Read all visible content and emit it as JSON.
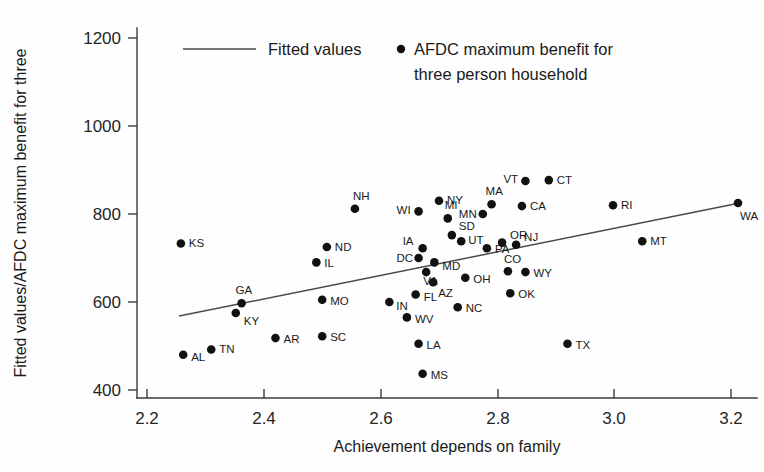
{
  "chart_data": {
    "type": "scatter",
    "title": "",
    "xlabel": "Achievement depends on family",
    "ylabel": "Fitted values/AFDC maximum benefit for three",
    "xlim": [
      2.15,
      3.26
    ],
    "ylim": [
      390,
      1240
    ],
    "xticks": [
      "2.2",
      "2.4",
      "2.6",
      "2.8",
      "3.0",
      "3.2"
    ],
    "xtick_values": [
      2.2,
      2.4,
      2.6,
      2.8,
      3.0,
      3.2
    ],
    "yticks": [
      "400",
      "600",
      "800",
      "1000",
      "1200"
    ],
    "ytick_values": [
      400,
      600,
      800,
      1000,
      1200
    ],
    "grid": false,
    "legend_position": "top-center",
    "legend": [
      {
        "label": "Fitted values",
        "marker": "line"
      },
      {
        "label": "AFDC maximum benefit for",
        "label2": "three person household",
        "marker": "dot"
      }
    ],
    "series": [
      {
        "name": "AFDC maximum benefit for three person household",
        "marker": "dot",
        "points": [
          {
            "label": "KS",
            "x": 2.258,
            "y": 733,
            "lx": 8,
            "ly": 4
          },
          {
            "label": "GA",
            "x": 2.362,
            "y": 597,
            "lx": -6,
            "ly": -9
          },
          {
            "label": "KY",
            "x": 2.352,
            "y": 575,
            "lx": 8,
            "ly": 12
          },
          {
            "label": "AL",
            "x": 2.262,
            "y": 480,
            "lx": 8,
            "ly": 6
          },
          {
            "label": "TN",
            "x": 2.31,
            "y": 492,
            "lx": 8,
            "ly": 3
          },
          {
            "label": "AR",
            "x": 2.42,
            "y": 518,
            "lx": 8,
            "ly": 5
          },
          {
            "label": "SC",
            "x": 2.5,
            "y": 522,
            "lx": 8,
            "ly": 5
          },
          {
            "label": "MO",
            "x": 2.5,
            "y": 605,
            "lx": 8,
            "ly": 5
          },
          {
            "label": "IL",
            "x": 2.49,
            "y": 690,
            "lx": 8,
            "ly": 5
          },
          {
            "label": "ND",
            "x": 2.508,
            "y": 725,
            "lx": 8,
            "ly": 4
          },
          {
            "label": "NH",
            "x": 2.556,
            "y": 812,
            "lx": -2,
            "ly": -9
          },
          {
            "label": "IN",
            "x": 2.615,
            "y": 600,
            "lx": 7,
            "ly": 8
          },
          {
            "label": "WV",
            "x": 2.645,
            "y": 565,
            "lx": 8,
            "ly": 6
          },
          {
            "label": "WI",
            "x": 2.665,
            "y": 806,
            "lx": -22,
            "ly": 3
          },
          {
            "label": "FL",
            "x": 2.66,
            "y": 617,
            "lx": 8,
            "ly": 6
          },
          {
            "label": "DC",
            "x": 2.665,
            "y": 700,
            "lx": -22,
            "ly": 4
          },
          {
            "label": "IA",
            "x": 2.672,
            "y": 722,
            "lx": -20,
            "ly": -3
          },
          {
            "label": "NY",
            "x": 2.7,
            "y": 830,
            "lx": 8,
            "ly": 3
          },
          {
            "label": "VA",
            "x": 2.678,
            "y": 668,
            "lx": -3,
            "ly": 13
          },
          {
            "label": "MD",
            "x": 2.692,
            "y": 690,
            "lx": 8,
            "ly": 8
          },
          {
            "label": "AZ",
            "x": 2.69,
            "y": 645,
            "lx": 5,
            "ly": 15
          },
          {
            "label": "MS",
            "x": 2.672,
            "y": 437,
            "lx": 8,
            "ly": 5
          },
          {
            "label": "LA",
            "x": 2.665,
            "y": 505,
            "lx": 8,
            "ly": 5
          },
          {
            "label": "MI",
            "x": 2.715,
            "y": 790,
            "lx": -3,
            "ly": -9
          },
          {
            "label": "SD",
            "x": 2.722,
            "y": 752,
            "lx": 7,
            "ly": -5
          },
          {
            "label": "UT",
            "x": 2.738,
            "y": 738,
            "lx": 7,
            "ly": 3
          },
          {
            "label": "OH",
            "x": 2.745,
            "y": 655,
            "lx": 8,
            "ly": 5
          },
          {
            "label": "NC",
            "x": 2.732,
            "y": 588,
            "lx": 8,
            "ly": 5
          },
          {
            "label": "MN",
            "x": 2.775,
            "y": 800,
            "lx": -24,
            "ly": 4
          },
          {
            "label": "MA",
            "x": 2.79,
            "y": 822,
            "lx": -6,
            "ly": -9
          },
          {
            "label": "PA",
            "x": 2.782,
            "y": 722,
            "lx": 8,
            "ly": 5
          },
          {
            "label": "OR",
            "x": 2.808,
            "y": 735,
            "lx": 8,
            "ly": -4
          },
          {
            "label": "VT",
            "x": 2.848,
            "y": 875,
            "lx": -22,
            "ly": 2
          },
          {
            "label": "CT",
            "x": 2.888,
            "y": 877,
            "lx": 8,
            "ly": 4
          },
          {
            "label": "CA",
            "x": 2.842,
            "y": 818,
            "lx": 8,
            "ly": 4
          },
          {
            "label": "NJ",
            "x": 2.832,
            "y": 730,
            "lx": 8,
            "ly": -4
          },
          {
            "label": "CO",
            "x": 2.818,
            "y": 670,
            "lx": -4,
            "ly": -8
          },
          {
            "label": "WY",
            "x": 2.848,
            "y": 668,
            "lx": 8,
            "ly": 5
          },
          {
            "label": "OK",
            "x": 2.822,
            "y": 620,
            "lx": 8,
            "ly": 5
          },
          {
            "label": "TX",
            "x": 2.92,
            "y": 505,
            "lx": 8,
            "ly": 5
          },
          {
            "label": "RI",
            "x": 2.998,
            "y": 820,
            "lx": 8,
            "ly": 4
          },
          {
            "label": "MT",
            "x": 3.048,
            "y": 738,
            "lx": 8,
            "ly": 4
          },
          {
            "label": "WA",
            "x": 3.212,
            "y": 825,
            "lx": 2,
            "ly": 17
          }
        ]
      },
      {
        "name": "Fitted values",
        "marker": "line",
        "x": [
          2.255,
          3.215
        ],
        "y": [
          568,
          825
        ]
      }
    ]
  }
}
